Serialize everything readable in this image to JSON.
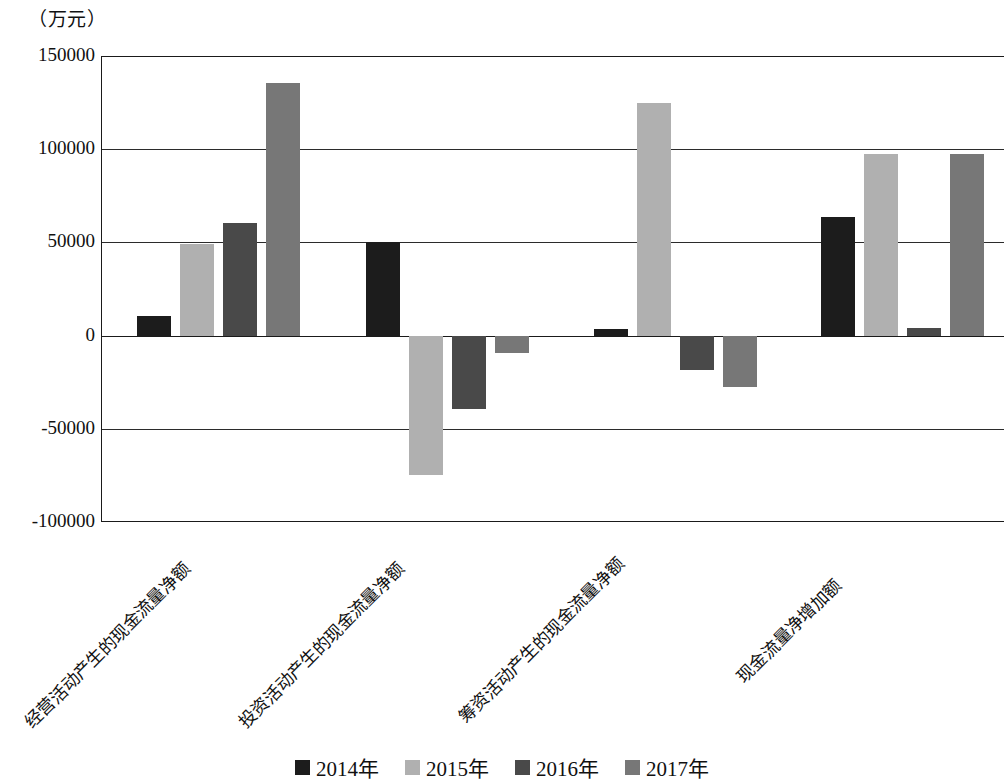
{
  "unit_label": "（万元）",
  "chart_data": {
    "type": "bar",
    "title": "",
    "subtitle": "",
    "xlabel": "",
    "ylabel": "（万元）",
    "unit": "万元",
    "ylim": [
      -100000,
      150000
    ],
    "yticks": [
      150000,
      100000,
      50000,
      0,
      -50000,
      -100000
    ],
    "ytick_labels": [
      "150000",
      "100000",
      "50000",
      "0",
      "-50000",
      "-100000"
    ],
    "grid": true,
    "legend_position": "bottom",
    "categories": [
      "经营活动产生的现金流量净额",
      "投资活动产生的现金流量净额",
      "筹资活动产生的现金流量净额",
      "现金流量净增加额"
    ],
    "series": [
      {
        "name": "2014年",
        "color": "#1c1c1c",
        "values": [
          10500,
          50000,
          3500,
          63500
        ]
      },
      {
        "name": "2015年",
        "color": "#b0b0b0",
        "values": [
          49000,
          -74800,
          125000,
          97400
        ]
      },
      {
        "name": "2016年",
        "color": "#494949",
        "values": [
          60500,
          -39400,
          -18400,
          4000
        ]
      },
      {
        "name": "2017年",
        "color": "#777777",
        "values": [
          135500,
          -9300,
          -27600,
          97400
        ]
      }
    ]
  },
  "legend": {
    "items": [
      {
        "label": "2014年",
        "color": "#1c1c1c"
      },
      {
        "label": "2015年",
        "color": "#b0b0b0"
      },
      {
        "label": "2016年",
        "color": "#494949"
      },
      {
        "label": "2017年",
        "color": "#777777"
      }
    ]
  }
}
